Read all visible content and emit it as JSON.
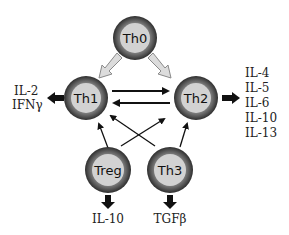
{
  "diagram": {
    "colors": {
      "ring_outer": "#3a3a3a",
      "ring_mid": "#6a6a6a",
      "cell_fill": "#d2d2d2",
      "hollow_arrow_fill": "#dcdcdc",
      "hollow_arrow_stroke": "#8a8a8a",
      "arrow": "#111111"
    },
    "cells": [
      {
        "id": "th0",
        "label": "Th0",
        "cx": 135,
        "cy": 38
      },
      {
        "id": "th1",
        "label": "Th1",
        "cx": 86,
        "cy": 98
      },
      {
        "id": "th2",
        "label": "Th2",
        "cx": 196,
        "cy": 98
      },
      {
        "id": "treg",
        "label": "Treg",
        "cx": 108,
        "cy": 170
      },
      {
        "id": "th3",
        "label": "Th3",
        "cx": 170,
        "cy": 170
      }
    ],
    "cytokines": {
      "th1": [
        "IL-2",
        "IFNγ"
      ],
      "th2": [
        "IL-4",
        "IL-5",
        "IL-6",
        "IL-10",
        "IL-13"
      ],
      "treg": [
        "IL-10"
      ],
      "th3": [
        "TGFβ"
      ]
    },
    "edges": [
      {
        "from": "Th0",
        "to": "Th1",
        "style": "hollow"
      },
      {
        "from": "Th0",
        "to": "Th2",
        "style": "hollow"
      },
      {
        "from": "Th1",
        "to": "Th2",
        "style": "solid"
      },
      {
        "from": "Th2",
        "to": "Th1",
        "style": "solid"
      },
      {
        "from": "Treg",
        "to": "Th1",
        "style": "thin"
      },
      {
        "from": "Treg",
        "to": "Th2",
        "style": "thin"
      },
      {
        "from": "Th3",
        "to": "Th1",
        "style": "thin"
      },
      {
        "from": "Th3",
        "to": "Th2",
        "style": "thin"
      }
    ]
  }
}
